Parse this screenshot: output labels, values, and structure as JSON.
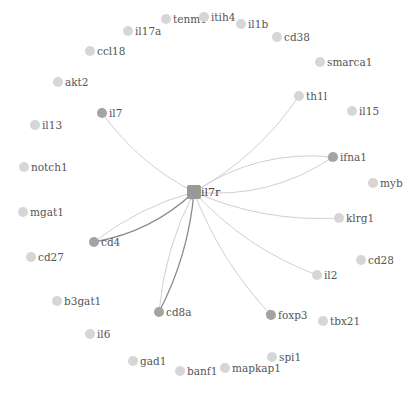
{
  "graph": {
    "hub": {
      "id": "il7r",
      "label": "il7r",
      "x": 194,
      "y": 192
    },
    "colors": {
      "node_default": "#d6d6d6",
      "node_linked": "#a3a3a3",
      "hub": "#999999",
      "edge_light": "#d0d0d0",
      "edge_dark": "#8a8a8a",
      "label": "#555555"
    },
    "nodes": [
      {
        "id": "tenm1",
        "label": "tenm1",
        "x": 166,
        "y": 19,
        "linked": false
      },
      {
        "id": "itih4",
        "label": "itih4",
        "x": 204,
        "y": 17,
        "linked": false
      },
      {
        "id": "il1b",
        "label": "il1b",
        "x": 241,
        "y": 24,
        "linked": false
      },
      {
        "id": "cd38",
        "label": "cd38",
        "x": 277,
        "y": 37,
        "linked": false
      },
      {
        "id": "smarca1",
        "label": "smarca1",
        "x": 320,
        "y": 62,
        "linked": false
      },
      {
        "id": "th1l",
        "label": "th1l",
        "x": 299,
        "y": 96,
        "linked": false
      },
      {
        "id": "il15",
        "label": "il15",
        "x": 352,
        "y": 111,
        "linked": false
      },
      {
        "id": "ifna1",
        "label": "ifna1",
        "x": 333,
        "y": 157,
        "linked": true
      },
      {
        "id": "myb",
        "label": "myb",
        "x": 373,
        "y": 183,
        "linked": false
      },
      {
        "id": "klrg1",
        "label": "klrg1",
        "x": 339,
        "y": 218,
        "linked": false
      },
      {
        "id": "cd28",
        "label": "cd28",
        "x": 361,
        "y": 260,
        "linked": false
      },
      {
        "id": "il2",
        "label": "il2",
        "x": 317,
        "y": 275,
        "linked": false
      },
      {
        "id": "tbx21",
        "label": "tbx21",
        "x": 323,
        "y": 321,
        "linked": false
      },
      {
        "id": "foxp3",
        "label": "foxp3",
        "x": 271,
        "y": 315,
        "linked": true
      },
      {
        "id": "spi1",
        "label": "spi1",
        "x": 272,
        "y": 357,
        "linked": false
      },
      {
        "id": "mapkap1",
        "label": "mapkap1",
        "x": 225,
        "y": 368,
        "linked": false
      },
      {
        "id": "banf1",
        "label": "banf1",
        "x": 180,
        "y": 371,
        "linked": false
      },
      {
        "id": "gad1",
        "label": "gad1",
        "x": 133,
        "y": 361,
        "linked": false
      },
      {
        "id": "il6",
        "label": "il6",
        "x": 90,
        "y": 334,
        "linked": false
      },
      {
        "id": "b3gat1",
        "label": "b3gat1",
        "x": 57,
        "y": 301,
        "linked": false
      },
      {
        "id": "cd8a",
        "label": "cd8a",
        "x": 159,
        "y": 312,
        "linked": true
      },
      {
        "id": "cd27",
        "label": "cd27",
        "x": 31,
        "y": 257,
        "linked": false
      },
      {
        "id": "cd4",
        "label": "cd4",
        "x": 94,
        "y": 242,
        "linked": true
      },
      {
        "id": "mgat1",
        "label": "mgat1",
        "x": 23,
        "y": 212,
        "linked": false
      },
      {
        "id": "notch1",
        "label": "notch1",
        "x": 24,
        "y": 167,
        "linked": false
      },
      {
        "id": "il13",
        "label": "il13",
        "x": 35,
        "y": 125,
        "linked": false
      },
      {
        "id": "il7",
        "label": "il7",
        "x": 102,
        "y": 113,
        "linked": true
      },
      {
        "id": "akt2",
        "label": "akt2",
        "x": 58,
        "y": 82,
        "linked": false
      },
      {
        "id": "ccl18",
        "label": "ccl18",
        "x": 90,
        "y": 51,
        "linked": false
      },
      {
        "id": "il17a",
        "label": "il17a",
        "x": 128,
        "y": 31,
        "linked": false
      }
    ],
    "edges": [
      {
        "from": "il7",
        "to": "il7r",
        "style": "light",
        "arrow": false,
        "curve": 0.12
      },
      {
        "from": "th1l",
        "to": "il7r",
        "style": "light",
        "arrow": false,
        "curve": -0.12
      },
      {
        "from": "il7r",
        "to": "ifna1",
        "style": "light",
        "arrow": true,
        "curve": 0.18
      },
      {
        "from": "ifna1",
        "to": "il7r",
        "style": "light",
        "arrow": false,
        "curve": 0.18
      },
      {
        "from": "il7r",
        "to": "klrg1",
        "style": "light",
        "arrow": false,
        "curve": 0.12
      },
      {
        "from": "il7r",
        "to": "il2",
        "style": "light",
        "arrow": false,
        "curve": 0.12
      },
      {
        "from": "il7r",
        "to": "foxp3",
        "style": "light",
        "arrow": true,
        "curve": 0.1
      },
      {
        "from": "cd4",
        "to": "il7r",
        "style": "dark",
        "arrow": true,
        "curve": 0.15
      },
      {
        "from": "cd4",
        "to": "il7r",
        "style": "light",
        "arrow": true,
        "curve": -0.1
      },
      {
        "from": "cd8a",
        "to": "il7r",
        "style": "dark",
        "arrow": true,
        "curve": 0.1
      },
      {
        "from": "il7r",
        "to": "cd8a",
        "style": "light",
        "arrow": false,
        "curve": 0.1
      }
    ]
  }
}
